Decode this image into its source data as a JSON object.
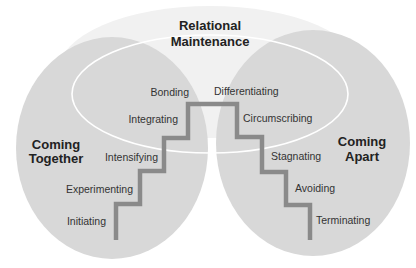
{
  "diagram": {
    "type": "relational-development-model",
    "colors": {
      "background": "#ffffff",
      "top_region_fill": "#f1f1f1",
      "side_region_fill": "#d8d8d8",
      "maintenance_outline": "#ffffff",
      "staircase": "#8a8a8a",
      "label_text": "#333333",
      "title_text": "#222222"
    },
    "regions": {
      "maintenance": {
        "title_line1": "Relational",
        "title_line2": "Maintenance"
      },
      "coming_together": {
        "title_line1": "Coming",
        "title_line2": "Together"
      },
      "coming_apart": {
        "title_line1": "Coming",
        "title_line2": "Apart"
      }
    },
    "coming_together_stages": [
      "Initiating",
      "Experimenting",
      "Intensifying",
      "Integrating",
      "Bonding"
    ],
    "coming_apart_stages": [
      "Differentiating",
      "Circumscribing",
      "Stagnating",
      "Avoiding",
      "Terminating"
    ]
  }
}
